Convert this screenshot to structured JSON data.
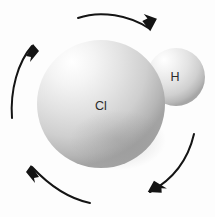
{
  "figure": {
    "background_color": "#fdfdfd",
    "width": 215,
    "height": 217
  },
  "molecule": {
    "name": "hydrogen-chloride",
    "atoms": [
      {
        "id": "chlorine",
        "label": "Cl",
        "cx": 101,
        "cy": 104,
        "r": 64,
        "highlight_x": 72,
        "highlight_y": 62,
        "light_color": "#fdfdfd",
        "mid_color": "#dcdcdc",
        "edge_color": "#9a9a9a",
        "label_x": 101,
        "label_y": 107
      },
      {
        "id": "hydrogen",
        "label": "H",
        "cx": 176,
        "cy": 77,
        "r": 29,
        "highlight_x": 164,
        "highlight_y": 60,
        "light_color": "#fcfcfc",
        "mid_color": "#dedede",
        "edge_color": "#9e9e9e",
        "label_x": 175,
        "label_y": 78
      }
    ]
  },
  "arrows": [
    {
      "id": "top-arrow",
      "direction": "clockwise-right",
      "path": "M 78,18 C 100,10 130,15 150,29",
      "head_points": "151,31 140,24 144,20 139,17 153,17",
      "head_transform": "rotate(20 150 29)",
      "stroke_width": 2.0
    },
    {
      "id": "left-arrow",
      "direction": "upward",
      "path": "M 12,118 C 10,90 18,62 32,46",
      "head_points": "33,44 26,56 31,57 30,62 39,51",
      "head_transform": "rotate(0 32 46)",
      "stroke_width": 2.0
    },
    {
      "id": "bottom-left-arrow",
      "direction": "up-left",
      "path": "M 90,203 C 66,198 46,182 32,167",
      "head_points": "31,165 39,177 34,178 35,183 26,172",
      "head_transform": "rotate(0 32 167)",
      "stroke_width": 2.0
    },
    {
      "id": "bottom-right-arrow",
      "direction": "down-left",
      "path": "M 194,134 C 188,160 172,180 150,192",
      "head_points": "148,193 161,188 159,184 164,182 149,180",
      "head_transform": "rotate(24 150 192)",
      "stroke_width": 2.0
    }
  ],
  "colors": {
    "stroke": "#141414",
    "label": "#2b2b2b",
    "background": "#fdfdfd"
  }
}
